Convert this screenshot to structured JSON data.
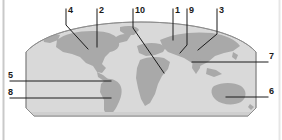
{
  "figure": {
    "type": "labeled-world-map-diagram",
    "title": "",
    "background_color": "#ffffff",
    "ocean_color": "#d8d8d8",
    "land_color": "#a8a8a8",
    "outline_color": "#7a7a7a",
    "leader_line_color": "#1a1a1a",
    "label_color": "#1a1a1a",
    "edge_rule_color": "#c9c9c9"
  },
  "callouts": [
    {
      "id": "callout-1",
      "label": "1",
      "x": 175,
      "y": 6,
      "side": "top"
    },
    {
      "id": "callout-2",
      "label": "2",
      "x": 99,
      "y": 6,
      "side": "top"
    },
    {
      "id": "callout-3",
      "label": "3",
      "x": 219,
      "y": 6,
      "side": "top"
    },
    {
      "id": "callout-4",
      "label": "4",
      "x": 68,
      "y": 6,
      "side": "top"
    },
    {
      "id": "callout-5",
      "label": "5",
      "x": 8,
      "y": 74,
      "side": "left"
    },
    {
      "id": "callout-6",
      "label": "6",
      "x": 269,
      "y": 90,
      "side": "right"
    },
    {
      "id": "callout-7",
      "label": "7",
      "x": 269,
      "y": 55,
      "side": "right"
    },
    {
      "id": "callout-8",
      "label": "8",
      "x": 8,
      "y": 91,
      "side": "left"
    },
    {
      "id": "callout-9",
      "label": "9",
      "x": 189,
      "y": 6,
      "side": "top"
    },
    {
      "id": "callout-10",
      "label": "10",
      "x": 135,
      "y": 6,
      "side": "top"
    }
  ]
}
